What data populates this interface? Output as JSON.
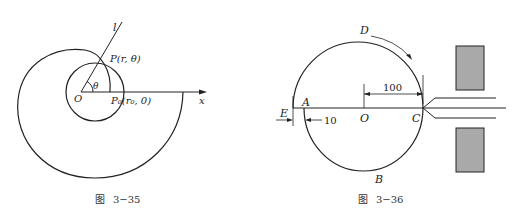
{
  "figures": [
    {
      "id": "fig-3-35",
      "caption_prefix": "图",
      "caption_number": "3−35",
      "labels": {
        "line_l": "l",
        "point_P": "P(r, θ)",
        "angle": "θ",
        "origin": "O",
        "point_P0": "P₀(r₀, 0)",
        "axis_x": "x"
      }
    },
    {
      "id": "fig-3-36",
      "caption_prefix": "图",
      "caption_number": "3−36",
      "labels": {
        "D": "D",
        "A": "A",
        "O": "O",
        "C": "C",
        "B": "B",
        "E": "E",
        "dim_100": "100",
        "dim_10": "10"
      }
    }
  ]
}
